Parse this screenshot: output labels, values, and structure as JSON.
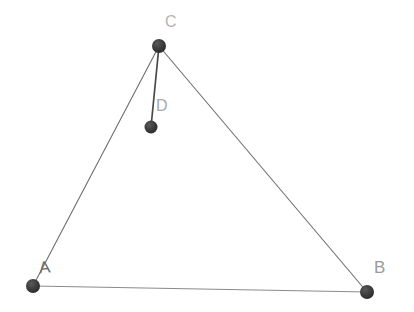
{
  "canvas": {
    "width": 414,
    "height": 312,
    "background_color": "#ffffff"
  },
  "diagram": {
    "type": "geometry-triangle-with-interior-point",
    "stroke_color": "#6e6e6e",
    "node_color": "#3a3a3a",
    "nodes": [
      {
        "id": "A",
        "label": "A",
        "x": 33,
        "y": 286,
        "radius": 7
      },
      {
        "id": "B",
        "label": "B",
        "x": 367,
        "y": 292,
        "radius": 7
      },
      {
        "id": "C",
        "label": "C",
        "x": 159,
        "y": 46,
        "radius": 7
      },
      {
        "id": "D",
        "label": "D",
        "x": 151,
        "y": 127,
        "radius": 6
      }
    ],
    "edges": [
      {
        "id": "AC",
        "from": "A",
        "to": "C",
        "stroke_width": 1.1,
        "color": "#6e6e6e"
      },
      {
        "id": "CB",
        "from": "C",
        "to": "B",
        "stroke_width": 1.1,
        "color": "#6e6e6e"
      },
      {
        "id": "AB",
        "from": "A",
        "to": "B",
        "stroke_width": 1.0,
        "color": "#8a8a8a"
      },
      {
        "id": "CD",
        "from": "C",
        "to": "D",
        "stroke_width": 1.7,
        "color": "#4a4a4a"
      }
    ],
    "labels": [
      {
        "id": "label-A",
        "text": "A",
        "x": 39,
        "y": 259,
        "color": "#6b6b6b"
      },
      {
        "id": "label-B",
        "text": "B",
        "x": 374,
        "y": 259,
        "color": "#9a9a9a"
      },
      {
        "id": "label-C",
        "text": "C",
        "x": 165,
        "y": 14,
        "color": "#b4b4b4"
      },
      {
        "id": "label-D",
        "text": "D",
        "x": 156,
        "y": 98,
        "color": "#a8a8a8"
      }
    ]
  }
}
